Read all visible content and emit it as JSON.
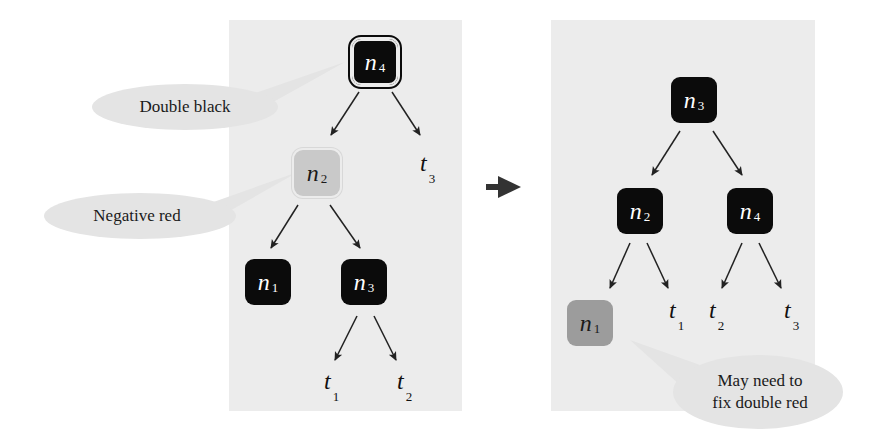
{
  "diagram": {
    "title": "",
    "transition_arrow": "right-arrow",
    "colors": {
      "panel_bg": "#ececec",
      "black_node": "#0b0b0b",
      "negative_red_node": "#c9c9c9",
      "red_node": "#9c9c9c",
      "callout_bg": "#e4e4e4"
    },
    "before": {
      "nodes": [
        {
          "id": "n4",
          "base": "n",
          "sub": "4",
          "color": "double-black"
        },
        {
          "id": "n2",
          "base": "n",
          "sub": "2",
          "color": "negative-red"
        },
        {
          "id": "n1",
          "base": "n",
          "sub": "1",
          "color": "black"
        },
        {
          "id": "n3",
          "base": "n",
          "sub": "3",
          "color": "black"
        }
      ],
      "leaves": [
        {
          "id": "t3",
          "base": "t",
          "sub": "3"
        },
        {
          "id": "t1",
          "base": "t",
          "sub": "1"
        },
        {
          "id": "t2",
          "base": "t",
          "sub": "2"
        }
      ],
      "edges": [
        [
          "n4",
          "n2"
        ],
        [
          "n4",
          "t3"
        ],
        [
          "n2",
          "n1"
        ],
        [
          "n2",
          "n3"
        ],
        [
          "n3",
          "t1"
        ],
        [
          "n3",
          "t2"
        ]
      ],
      "callouts": [
        {
          "text": "Double black",
          "target": "n4"
        },
        {
          "text": "Negative red",
          "target": "n2"
        }
      ]
    },
    "after": {
      "nodes": [
        {
          "id": "n3",
          "base": "n",
          "sub": "3",
          "color": "black"
        },
        {
          "id": "n2",
          "base": "n",
          "sub": "2",
          "color": "black"
        },
        {
          "id": "n4",
          "base": "n",
          "sub": "4",
          "color": "black"
        },
        {
          "id": "n1",
          "base": "n",
          "sub": "1",
          "color": "red"
        }
      ],
      "leaves": [
        {
          "id": "t1",
          "base": "t",
          "sub": "1"
        },
        {
          "id": "t2",
          "base": "t",
          "sub": "2"
        },
        {
          "id": "t3",
          "base": "t",
          "sub": "3"
        }
      ],
      "edges": [
        [
          "n3",
          "n2"
        ],
        [
          "n3",
          "n4"
        ],
        [
          "n2",
          "n1"
        ],
        [
          "n2",
          "t1"
        ],
        [
          "n4",
          "t2"
        ],
        [
          "n4",
          "t3"
        ]
      ],
      "callouts": [
        {
          "line1": "May need to",
          "line2": "fix double red",
          "target": "n1"
        }
      ]
    }
  }
}
